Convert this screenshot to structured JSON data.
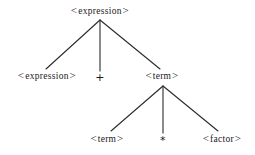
{
  "diagram": {
    "type": "parse-tree",
    "background_color": "#ffffff",
    "line_color": "#2b2b2b",
    "text_color": "#1a1a1a"
  },
  "nodes": [
    {
      "id": "root",
      "label": "<expression>",
      "open": "<",
      "text": "expression",
      "close": ">",
      "kind": "nonterminal",
      "x": 100,
      "y": 11,
      "level": 1
    },
    {
      "id": "expr-left",
      "label": "<expression>",
      "open": "<",
      "text": "expression",
      "close": ">",
      "kind": "nonterminal",
      "x": 47,
      "y": 76,
      "level": 2
    },
    {
      "id": "plus",
      "label": "+",
      "open": "",
      "text": "+",
      "close": "",
      "kind": "terminal",
      "x": 100,
      "y": 77,
      "level": 2
    },
    {
      "id": "term-right",
      "label": "<term>",
      "open": "<",
      "text": "term",
      "close": ">",
      "kind": "nonterminal",
      "x": 162,
      "y": 76,
      "level": 2
    },
    {
      "id": "term-leaf",
      "label": "<term>",
      "open": "<",
      "text": "term",
      "close": ">",
      "kind": "nonterminal",
      "x": 107,
      "y": 139,
      "level": 3
    },
    {
      "id": "star",
      "label": "*",
      "open": "",
      "text": "*",
      "close": "",
      "kind": "terminal",
      "x": 163,
      "y": 140,
      "level": 3
    },
    {
      "id": "factor",
      "label": "<factor>",
      "open": "<",
      "text": "factor",
      "close": ">",
      "kind": "nonterminal",
      "x": 222,
      "y": 139,
      "level": 3
    }
  ],
  "edges": [
    {
      "id": "root-to-expr-left",
      "from": "root",
      "to": "expr-left",
      "x1": 100,
      "y1": 20,
      "x2": 46,
      "y2": 69
    },
    {
      "id": "root-to-plus",
      "from": "root",
      "to": "plus",
      "x1": 100,
      "y1": 20,
      "x2": 100,
      "y2": 71
    },
    {
      "id": "root-to-term",
      "from": "root",
      "to": "term-right",
      "x1": 100,
      "y1": 20,
      "x2": 160,
      "y2": 69
    },
    {
      "id": "term-to-term-leaf",
      "from": "term-right",
      "to": "term-leaf",
      "x1": 163,
      "y1": 86,
      "x2": 111,
      "y2": 131
    },
    {
      "id": "term-to-star",
      "from": "term-right",
      "to": "star",
      "x1": 163,
      "y1": 86,
      "x2": 163,
      "y2": 133
    },
    {
      "id": "term-to-factor",
      "from": "term-right",
      "to": "factor",
      "x1": 163,
      "y1": 86,
      "x2": 218,
      "y2": 131
    }
  ]
}
